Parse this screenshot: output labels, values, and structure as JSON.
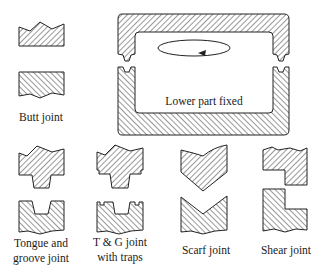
{
  "diagram": {
    "colors": {
      "stroke": "#222222",
      "hatch": "#333333",
      "background": "#ffffff"
    },
    "joints": [
      {
        "id": "butt",
        "label_lines": [
          "Butt joint"
        ]
      },
      {
        "id": "tongue-groove",
        "label_lines": [
          "Tongue and",
          "groove joint"
        ]
      },
      {
        "id": "tg-traps",
        "label_lines": [
          "T & G joint",
          "with traps"
        ]
      },
      {
        "id": "scarf",
        "label_lines": [
          "Scarf joint"
        ]
      },
      {
        "id": "shear",
        "label_lines": [
          "Shear joint"
        ]
      }
    ],
    "mold": {
      "label": "Lower part fixed",
      "rotation_arrow": "counter-clockwise-ellipse-arrow"
    }
  }
}
